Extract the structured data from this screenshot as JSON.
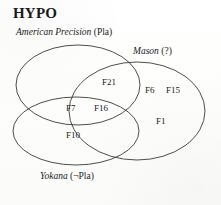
{
  "figure": {
    "title": "HYPO",
    "type": "venn-diagram",
    "set_count": 3
  },
  "sets": [
    {
      "id": "american-precision",
      "name": "American Precision",
      "qualifier": "(Pla)",
      "position": "upper-left"
    },
    {
      "id": "mason",
      "name": "Mason",
      "qualifier": "(?)",
      "position": "right"
    },
    {
      "id": "yokana",
      "name": "Yokana",
      "qualifier": "(¬Pla)",
      "position": "lower-left"
    }
  ],
  "regions": [
    {
      "id": "f21",
      "label": "F21",
      "membership": [
        "american-precision",
        "mason"
      ]
    },
    {
      "id": "f6",
      "label": "F6",
      "membership": [
        "mason"
      ]
    },
    {
      "id": "f15",
      "label": "F15",
      "membership": [
        "mason"
      ]
    },
    {
      "id": "f7",
      "label": "F7",
      "membership": [
        "american-precision",
        "yokana"
      ]
    },
    {
      "id": "f16",
      "label": "F16",
      "membership": [
        "american-precision",
        "mason",
        "yokana"
      ]
    },
    {
      "id": "f1",
      "label": "F1",
      "membership": [
        "mason"
      ]
    },
    {
      "id": "f10",
      "label": "F10",
      "membership": [
        "yokana"
      ]
    }
  ],
  "style": {
    "stroke_color": "#3a3a3a",
    "background_color": "#fdfdfc",
    "text_color": "#1a1a1a"
  }
}
